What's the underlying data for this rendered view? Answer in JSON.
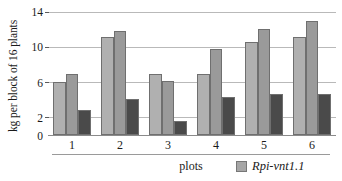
{
  "chart_data": {
    "type": "bar",
    "title": "",
    "subtitle": "",
    "xlabel": "plots",
    "ylabel": "kg per block of 16 plants",
    "categories": [
      "1",
      "2",
      "3",
      "4",
      "5",
      "6"
    ],
    "yticks": [
      0,
      2,
      6,
      10,
      14
    ],
    "ylim": [
      0,
      14
    ],
    "grid": true,
    "grid_values": [
      2,
      6,
      10,
      14
    ],
    "legend_position": "bottom-right",
    "series": [
      {
        "name": "series-1",
        "color": "#b0b0b0",
        "values": [
          6.0,
          11.1,
          6.9,
          7.0,
          10.6,
          11.1
        ]
      },
      {
        "name": "series-2",
        "color": "#9a9a9a",
        "values": [
          7.0,
          11.8,
          6.1,
          9.8,
          12.1,
          13.0
        ]
      },
      {
        "name": "series-3",
        "color": "#4a4a4a",
        "values": [
          2.9,
          4.1,
          1.6,
          4.3,
          4.7,
          4.7
        ]
      }
    ],
    "legend": [
      {
        "label": "Rpi-vnt1.1",
        "color": "#a6a6a6"
      }
    ]
  },
  "axis": {
    "y_tick_labels": [
      "14",
      "10",
      "6",
      "2",
      "0"
    ],
    "x_tick_labels": [
      "1",
      "2",
      "3",
      "4",
      "5",
      "6"
    ]
  }
}
